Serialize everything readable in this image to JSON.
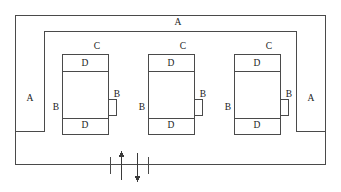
{
  "diagram": {
    "stroke_color": "#4a4a4a",
    "text_color": "#1a1a1a",
    "background": "#ffffff",
    "labels": {
      "outer_top": "A",
      "left_column": "A",
      "right_column": "A",
      "unit_top": "C",
      "band_top": "D",
      "band_bottom": "D",
      "side_left": "B",
      "side_right": "B"
    },
    "annotations": [
      {
        "id": "a-top",
        "text": "A",
        "x": 178,
        "y": 23
      },
      {
        "id": "a-left",
        "text": "A",
        "x": 30,
        "y": 99
      },
      {
        "id": "a-right",
        "text": "A",
        "x": 311,
        "y": 99
      },
      {
        "id": "c-unit-1",
        "text": "C",
        "x": 97,
        "y": 47
      },
      {
        "id": "c-unit-2",
        "text": "C",
        "x": 183,
        "y": 47
      },
      {
        "id": "c-unit-3",
        "text": "C",
        "x": 269,
        "y": 47
      },
      {
        "id": "d-top-1",
        "text": "D",
        "x": 85,
        "y": 64
      },
      {
        "id": "d-top-2",
        "text": "D",
        "x": 171,
        "y": 64
      },
      {
        "id": "d-top-3",
        "text": "D",
        "x": 257,
        "y": 64
      },
      {
        "id": "d-bottom-1",
        "text": "D",
        "x": 85,
        "y": 126
      },
      {
        "id": "d-bottom-2",
        "text": "D",
        "x": 171,
        "y": 126
      },
      {
        "id": "d-bottom-3",
        "text": "D",
        "x": 257,
        "y": 126
      },
      {
        "id": "b-left-1",
        "text": "B",
        "x": 56,
        "y": 108
      },
      {
        "id": "b-left-2",
        "text": "B",
        "x": 142,
        "y": 108
      },
      {
        "id": "b-left-3",
        "text": "B",
        "x": 228,
        "y": 108
      },
      {
        "id": "b-right-1",
        "text": "B",
        "x": 117,
        "y": 95
      },
      {
        "id": "b-right-2",
        "text": "B",
        "x": 203,
        "y": 95
      },
      {
        "id": "b-right-3",
        "text": "B",
        "x": 289,
        "y": 95
      }
    ],
    "flow_arrows": [
      {
        "id": "arrow-up",
        "direction": "up",
        "x": 121
      },
      {
        "id": "arrow-down",
        "direction": "down",
        "x": 137
      }
    ]
  }
}
